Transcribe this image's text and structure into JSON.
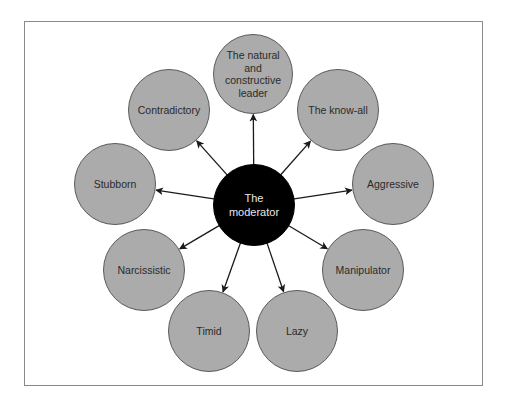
{
  "diagram": {
    "type": "hub-and-spoke",
    "center": {
      "label": "The\nmoderator",
      "lines": [
        "The",
        "moderator"
      ],
      "x": 254,
      "y": 205,
      "r": 41,
      "fill": "#000000"
    },
    "nodes": [
      {
        "id": "leader",
        "lines": [
          "The natural",
          "and",
          "constructive",
          "leader"
        ],
        "x": 253,
        "y": 74,
        "r": 40
      },
      {
        "id": "know-all",
        "lines": [
          "The know-all"
        ],
        "x": 338,
        "y": 110,
        "r": 41
      },
      {
        "id": "aggressive",
        "lines": [
          "Aggressive"
        ],
        "x": 393,
        "y": 184,
        "r": 41
      },
      {
        "id": "manipulator",
        "lines": [
          "Manipulator"
        ],
        "x": 363,
        "y": 270,
        "r": 41
      },
      {
        "id": "lazy",
        "lines": [
          "Lazy"
        ],
        "x": 297,
        "y": 331,
        "r": 41
      },
      {
        "id": "timid",
        "lines": [
          "Timid"
        ],
        "x": 209,
        "y": 331,
        "r": 41
      },
      {
        "id": "narcissistic",
        "lines": [
          "Narcissistic"
        ],
        "x": 144,
        "y": 270,
        "r": 41
      },
      {
        "id": "stubborn",
        "lines": [
          "Stubborn"
        ],
        "x": 115,
        "y": 184,
        "r": 41
      },
      {
        "id": "contradictory",
        "lines": [
          "Contradictory"
        ],
        "x": 169,
        "y": 110,
        "r": 41
      }
    ],
    "edges_from": "center",
    "node_fill": "#ababab",
    "arrow_color": "#1a1a1a"
  }
}
